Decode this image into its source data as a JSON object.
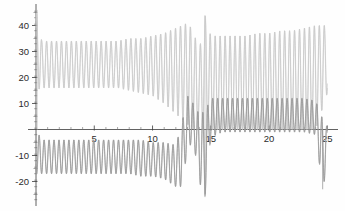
{
  "chart_data": {
    "type": "line",
    "title": "",
    "subtitle": "",
    "xlabel": "",
    "ylabel": "",
    "xlim": [
      0,
      25.4
    ],
    "ylim": [
      -27,
      47
    ],
    "grid": false,
    "legend": "none",
    "axes_style": "mathematica-cross-axes",
    "x_ticks_major": [
      5,
      10,
      15,
      20,
      25
    ],
    "x_ticks_major_labels": [
      "5",
      "10",
      "15",
      "20",
      "25"
    ],
    "x_ticks_minor": [
      1,
      2,
      3,
      4,
      6,
      7,
      8,
      9,
      11,
      12,
      13,
      14,
      16,
      17,
      18,
      19,
      21,
      22,
      23,
      24
    ],
    "y_ticks_major": [
      -20,
      -10,
      10,
      20,
      30,
      40
    ],
    "y_ticks_major_labels": [
      "-20",
      "-10",
      "10",
      "20",
      "30",
      "40"
    ],
    "y_ticks_minor": [
      -25,
      -15,
      -5,
      5,
      15,
      25,
      35,
      45
    ],
    "colors": {
      "curve_a": "#c9c9c9",
      "curve_b": "#9a9a9a",
      "axis": "#3a3a3a",
      "background": "#fefefe"
    },
    "series": [
      {
        "name": "curve-a",
        "color": "#c9c9c9",
        "description": "High-frequency oscillation, envelope ~+-10 about a mean that drifts from +25 down through 0, with a large resonance burst near x=13-15",
        "x": [
          0,
          0.5,
          1,
          2,
          3,
          4,
          5,
          6,
          7,
          8,
          9,
          10,
          11,
          12,
          12.5,
          13,
          13.5,
          14,
          14.5,
          15,
          16,
          17,
          18,
          19,
          20,
          21,
          22,
          23,
          24,
          25
        ],
        "envelope_upper": [
          46,
          34,
          34,
          34,
          34,
          34,
          34,
          34,
          34,
          35,
          35,
          36,
          37,
          39,
          40,
          41,
          38,
          30,
          44,
          36,
          36,
          36,
          36,
          37,
          37,
          38,
          38,
          39,
          40,
          40
        ],
        "envelope_lower": [
          15,
          16,
          16,
          16,
          16,
          16,
          16,
          16,
          16,
          15,
          14,
          13,
          10,
          6,
          4,
          2,
          0,
          0,
          0,
          0,
          0,
          0,
          0,
          0,
          0,
          0,
          0,
          0,
          0,
          14
        ],
        "mean_level": [
          30,
          25,
          25,
          25,
          25,
          25,
          25,
          25,
          25,
          25,
          24,
          24,
          23,
          22,
          21,
          20,
          18,
          14,
          20,
          18,
          18,
          18,
          18,
          18,
          18,
          19,
          19,
          19,
          20,
          27
        ]
      },
      {
        "name": "curve-b",
        "color": "#9a9a9a",
        "description": "Mirror/second branch oscillating below the axis early on (envelope -4 to -17) then rising above the axis after x~12.5 to oscillate between 0 and +12",
        "x": [
          0,
          0.5,
          1,
          2,
          3,
          4,
          5,
          6,
          7,
          8,
          9,
          10,
          11,
          12,
          12.5,
          13,
          13.5,
          14,
          14.5,
          15,
          16,
          17,
          18,
          19,
          20,
          21,
          22,
          23,
          24,
          24.6,
          25
        ],
        "envelope_upper": [
          0,
          -4,
          -4,
          -4,
          -4,
          -4,
          -4,
          -4,
          -4,
          -4,
          -4,
          -5,
          -5,
          -6,
          2,
          13,
          10,
          6,
          7,
          12,
          12,
          12,
          12,
          12,
          12,
          12,
          12,
          12,
          11,
          4,
          1
        ],
        "envelope_lower": [
          -17,
          -17,
          -17,
          -17,
          -17,
          -17,
          -17,
          -17,
          -17,
          -17,
          -18,
          -18,
          -19,
          -22,
          -22,
          -8,
          -4,
          -20,
          -26,
          -3,
          -1,
          -1,
          -1,
          -1,
          -1,
          -1,
          -1,
          -1,
          -2,
          -23,
          -14
        ],
        "mean_level": [
          -9,
          -10,
          -10,
          -10,
          -10,
          -10,
          -10,
          -10,
          -10,
          -10,
          -11,
          -11,
          -12,
          -13,
          -10,
          3,
          3,
          -6,
          -9,
          5,
          6,
          6,
          6,
          6,
          6,
          6,
          6,
          6,
          5,
          -10,
          -7
        ]
      }
    ],
    "annotations": [
      {
        "text": "tall spike",
        "x": 14.5,
        "y": 44
      },
      {
        "text": "deep spike",
        "x": 14.5,
        "y": -26
      },
      {
        "text": "deep spike",
        "x": 24.6,
        "y": -23
      },
      {
        "text": "initial vertical spike",
        "x": 0.1,
        "y": 46
      }
    ]
  }
}
